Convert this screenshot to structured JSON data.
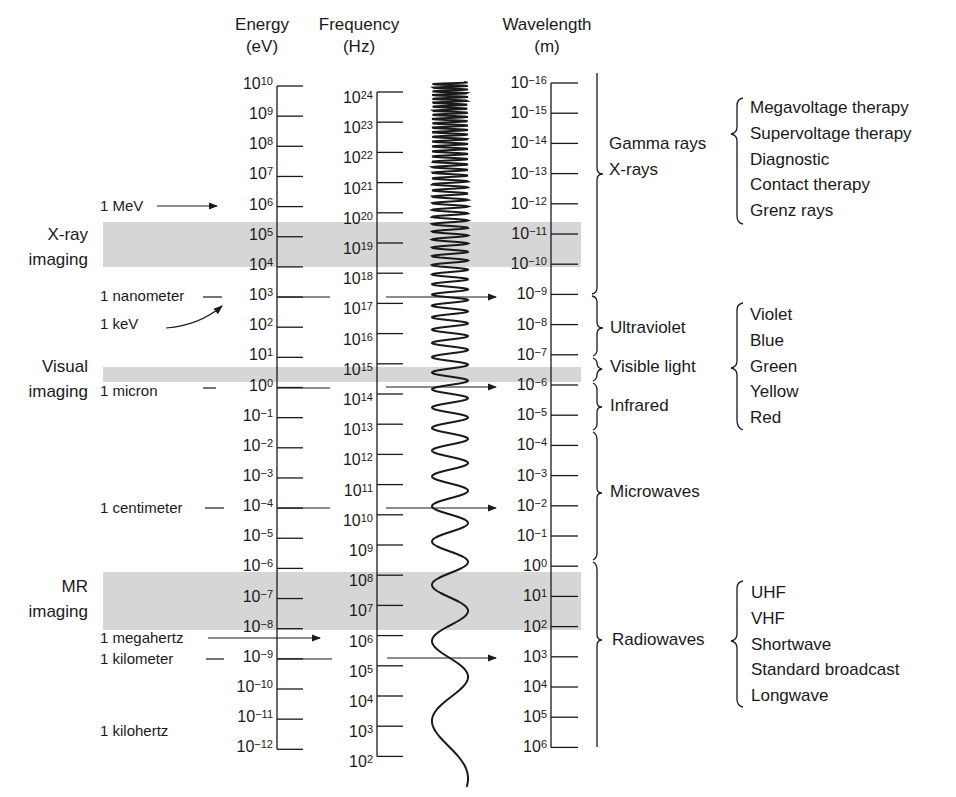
{
  "headers": {
    "energy": {
      "title": "Energy",
      "unit": "(eV)"
    },
    "frequency": {
      "title": "Frequency",
      "unit": "(Hz)"
    },
    "wavelength": {
      "title": "Wavelength",
      "unit": "(m)"
    }
  },
  "axes": {
    "energy": {
      "base": "10",
      "exponents": [
        "10",
        "9",
        "8",
        "7",
        "6",
        "5",
        "4",
        "3",
        "2",
        "1",
        "0",
        "−1",
        "−2",
        "−3",
        "−4",
        "−5",
        "−6",
        "−7",
        "−8",
        "−9",
        "−10",
        "−11",
        "−12"
      ]
    },
    "frequency": {
      "base": "10",
      "exponents": [
        "24",
        "23",
        "22",
        "21",
        "20",
        "19",
        "18",
        "17",
        "16",
        "15",
        "14",
        "13",
        "12",
        "11",
        "10",
        "9",
        "8",
        "7",
        "6",
        "5",
        "4",
        "3",
        "2"
      ]
    },
    "wavelength": {
      "base": "10",
      "exponents": [
        "−16",
        "−15",
        "−14",
        "−13",
        "−12",
        "−11",
        "−10",
        "−9",
        "−8",
        "−7",
        "−6",
        "−5",
        "−4",
        "−3",
        "−2",
        "−1",
        "0",
        "1",
        "2",
        "3",
        "4",
        "5",
        "6"
      ]
    }
  },
  "imaging_bands": {
    "xray": {
      "line1": "X-ray",
      "line2": "imaging"
    },
    "visual": {
      "line1": "Visual",
      "line2": "imaging"
    },
    "mr": {
      "line1": "MR",
      "line2": "imaging"
    }
  },
  "annotations": {
    "mev": "1 MeV",
    "nanometer": "1 nanometer",
    "kev": "1 keV",
    "micron": "1 micron",
    "centimeter": "1 centimeter",
    "megahertz": "1 megahertz",
    "kilometer": "1 kilometer",
    "kilohertz": "1 kilohertz"
  },
  "regions": {
    "gamma": {
      "line1": "Gamma rays",
      "line2": "X-rays"
    },
    "ultraviolet": "Ultraviolet",
    "visible": "Visible light",
    "infrared": "Infrared",
    "microwaves": "Microwaves",
    "radiowaves": "Radiowaves"
  },
  "sublists": {
    "therapy": [
      "Megavoltage therapy",
      "Supervoltage therapy",
      "Diagnostic",
      "Contact therapy",
      "Grenz rays"
    ],
    "colors": [
      "Violet",
      "Blue",
      "Green",
      "Yellow",
      "Red"
    ],
    "radio": [
      "UHF",
      "VHF",
      "Shortwave",
      "Standard broadcast",
      "Longwave"
    ]
  },
  "colors": {
    "ink": "#1a1a1a",
    "band": "#d6d6d6",
    "background": "#ffffff"
  }
}
